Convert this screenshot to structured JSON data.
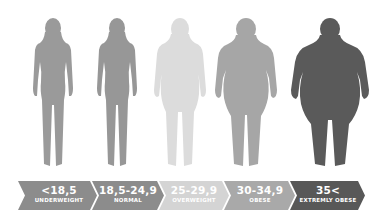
{
  "categories": [
    {
      "range": "<18,5",
      "label": "UNDERWEIGHT",
      "arrow_color": "#8c8c8c",
      "figure_color": "#9a9a9a"
    },
    {
      "range": "18,5-24,9",
      "label": "NORMAL",
      "arrow_color": "#8c8c8c",
      "figure_color": "#979797"
    },
    {
      "range": "25-29,9",
      "label": "OVERWEIGHT",
      "arrow_color": "#d4d4d4",
      "figure_color": "#dcdcdc"
    },
    {
      "range": "30-34,9",
      "label": "OBESE",
      "arrow_color": "#a9a9a9",
      "figure_color": "#a6a6a6"
    },
    {
      "range": "35<",
      "label": "EXTREMLY OBESE",
      "arrow_color": "#585858",
      "figure_color": "#5a5a5a"
    }
  ]
}
